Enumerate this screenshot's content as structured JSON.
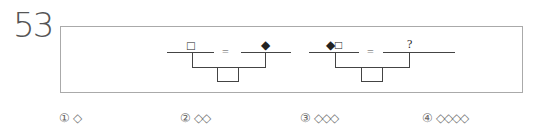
{
  "question": {
    "number": "53",
    "formula1": {
      "left_symbol": "□",
      "equals": "=",
      "right_symbol": "◆"
    },
    "formula2": {
      "left_symbol": "◆□",
      "equals": "=",
      "right_symbol": "?"
    }
  },
  "choices": [
    {
      "marker": "①",
      "value": "◇"
    },
    {
      "marker": "②",
      "value": "◇◇"
    },
    {
      "marker": "③",
      "value": "◇◇◇"
    },
    {
      "marker": "④",
      "value": "◇◇◇◇"
    }
  ]
}
